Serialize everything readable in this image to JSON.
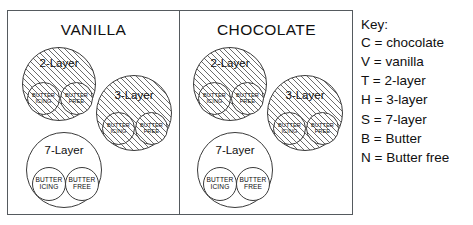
{
  "diagram": {
    "type": "venn-set-diagram",
    "panels": [
      {
        "id": "vanilla",
        "title": "VANILLA",
        "groups": [
          {
            "id": "vanilla-2-layer",
            "label": "2-Layer",
            "fill": "hatched",
            "subsets": [
              {
                "id": "butter-icing",
                "line1": "BUTTER",
                "line2": "ICING",
                "fill": "hatched"
              },
              {
                "id": "butter-free",
                "line1": "BUTTER",
                "line2": "FREE",
                "fill": "hatched"
              }
            ]
          },
          {
            "id": "vanilla-3-layer",
            "label": "3-Layer",
            "fill": "hatched",
            "subsets": [
              {
                "id": "butter-icing",
                "line1": "BUTTER",
                "line2": "ICING",
                "fill": "hatched"
              },
              {
                "id": "butter-free",
                "line1": "BUTTER",
                "line2": "FREE",
                "fill": "hatched"
              }
            ]
          },
          {
            "id": "vanilla-7-layer",
            "label": "7-Layer",
            "fill": "plain",
            "subsets": [
              {
                "id": "butter-icing",
                "line1": "BUTTER",
                "line2": "ICING",
                "fill": "plain"
              },
              {
                "id": "butter-free",
                "line1": "BUTTER",
                "line2": "FREE",
                "fill": "plain"
              }
            ]
          }
        ]
      },
      {
        "id": "chocolate",
        "title": "CHOCOLATE",
        "groups": [
          {
            "id": "chocolate-2-layer",
            "label": "2-Layer",
            "fill": "hatched",
            "subsets": [
              {
                "id": "butter-icing",
                "line1": "BUTTER",
                "line2": "ICING",
                "fill": "hatched"
              },
              {
                "id": "butter-free",
                "line1": "BUTTER",
                "line2": "FREE",
                "fill": "hatched"
              }
            ]
          },
          {
            "id": "chocolate-3-layer",
            "label": "3-Layer",
            "fill": "hatched",
            "subsets": [
              {
                "id": "butter-icing",
                "line1": "BUTTER",
                "line2": "ICING",
                "fill": "hatched"
              },
              {
                "id": "butter-free",
                "line1": "BUTTER",
                "line2": "FREE",
                "fill": "hatched"
              }
            ]
          },
          {
            "id": "chocolate-7-layer",
            "label": "7-Layer",
            "fill": "plain",
            "subsets": [
              {
                "id": "butter-icing",
                "line1": "BUTTER",
                "line2": "ICING",
                "fill": "plain"
              },
              {
                "id": "butter-free",
                "line1": "BUTTER",
                "line2": "FREE",
                "fill": "plain"
              }
            ]
          }
        ]
      }
    ]
  },
  "key": {
    "title": "Key:",
    "entries": [
      {
        "symbol": "C",
        "equals": "=",
        "meaning": "chocolate",
        "text": "C = chocolate"
      },
      {
        "symbol": "V",
        "equals": "=",
        "meaning": "vanilla",
        "text": "V = vanilla"
      },
      {
        "symbol": "T",
        "equals": "=",
        "meaning": "2-layer",
        "text": "T = 2-layer"
      },
      {
        "symbol": "H",
        "equals": "=",
        "meaning": "3-layer",
        "text": "H = 3-layer"
      },
      {
        "symbol": "S",
        "equals": "=",
        "meaning": "7-layer",
        "text": "S = 7-layer"
      },
      {
        "symbol": "B",
        "equals": "=",
        "meaning": "Butter",
        "text": "B = Butter"
      },
      {
        "symbol": "N",
        "equals": "=",
        "meaning": "Butter free",
        "text": "N = Butter free"
      }
    ]
  },
  "colors": {
    "frame": "#555a5e",
    "circle_stroke": "#3a3a3a",
    "hatch": "#6b6b6b",
    "text": "#101010",
    "background": "#ffffff"
  }
}
